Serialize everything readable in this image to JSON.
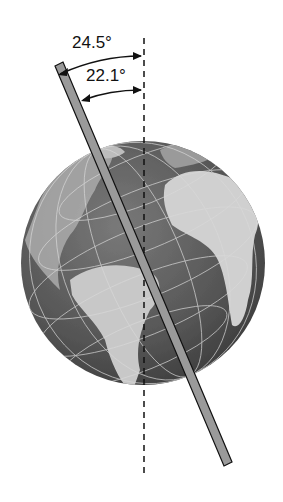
{
  "figure": {
    "labels": {
      "outer_angle": "24.5°",
      "inner_angle": "22.1°"
    },
    "colors": {
      "background": "#ffffff",
      "ocean": "#5a5a5a",
      "land": "#c8c8c8",
      "rod_fill": "#9a9a9a",
      "rod_edge": "#111111",
      "dashed_line": "#111111",
      "grid": "#d8d8d8"
    }
  }
}
